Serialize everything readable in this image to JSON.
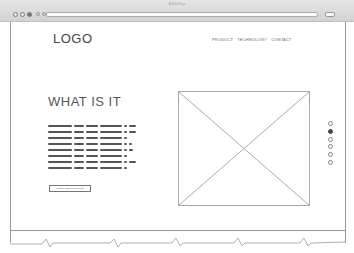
{
  "browser": {
    "title": "A Web Page",
    "window_controls": [
      "close",
      "minimize",
      "maximize"
    ],
    "icons": [
      "back-icon",
      "forward-icon",
      "refresh-icon",
      "search-icon"
    ]
  },
  "header": {
    "logo": "LOGO",
    "nav": [
      {
        "label": "PRODUCT"
      },
      {
        "label": "TECHNOLOGY"
      },
      {
        "label": "CONTACT"
      }
    ]
  },
  "hero": {
    "heading": "WHAT IS IT",
    "placeholder_text_lines": 8,
    "button_label": "MORE ABOUT BUTTON"
  },
  "media": {
    "image_placeholder": "image-placeholder"
  },
  "pager": {
    "dots": 6,
    "active_index": 1
  },
  "colors": {
    "lines": "#999999",
    "text": "#444444",
    "browser_bar": "#d9d9d9"
  }
}
